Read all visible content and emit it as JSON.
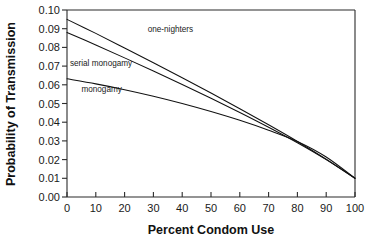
{
  "figure": {
    "background_color": "#ffffff",
    "line_color": "#111111",
    "axis_color": "#2b2b2b"
  },
  "chart_data": {
    "type": "line",
    "title": "",
    "xlabel": "Percent Condom Use",
    "ylabel": "Probability of Transmission",
    "xlim": [
      0,
      100
    ],
    "ylim": [
      0.0,
      0.1
    ],
    "xticks": [
      0,
      10,
      20,
      30,
      40,
      50,
      60,
      70,
      80,
      90,
      100
    ],
    "xtick_labels": [
      "0",
      "10",
      "20",
      "30",
      "40",
      "50",
      "60",
      "70",
      "80",
      "90",
      "100"
    ],
    "yticks": [
      0.0,
      0.01,
      0.02,
      0.03,
      0.04,
      0.05,
      0.06,
      0.07,
      0.08,
      0.09,
      0.1
    ],
    "ytick_labels": [
      "0.00",
      "0.01",
      "0.02",
      "0.03",
      "0.04",
      "0.05",
      "0.06",
      "0.07",
      "0.08",
      "0.09",
      "0.10"
    ],
    "grid": false,
    "legend_position": "inline-annotations",
    "x": [
      0,
      10,
      20,
      30,
      40,
      50,
      60,
      70,
      80,
      90,
      100
    ],
    "series": [
      {
        "name": "one-nighters",
        "label": "one-nighters",
        "label_x": 28,
        "label_y": 0.0885,
        "values": [
          0.095,
          0.0875,
          0.0797,
          0.0718,
          0.0638,
          0.0556,
          0.0472,
          0.0386,
          0.0297,
          0.0202,
          0.01
        ]
      },
      {
        "name": "serial monogamy",
        "label": "serial monogamy",
        "label_x": 1,
        "label_y": 0.07,
        "values": [
          0.088,
          0.0813,
          0.0744,
          0.0674,
          0.0602,
          0.0528,
          0.0452,
          0.0373,
          0.029,
          0.02,
          0.01
        ]
      },
      {
        "name": "monogamy",
        "label": "monogamy",
        "label_x": 5,
        "label_y": 0.056,
        "values": [
          0.0632,
          0.0605,
          0.0574,
          0.0539,
          0.05,
          0.0457,
          0.041,
          0.0357,
          0.0297,
          0.0214,
          0.01
        ]
      }
    ]
  },
  "caption": {
    "clipped_text": ""
  }
}
